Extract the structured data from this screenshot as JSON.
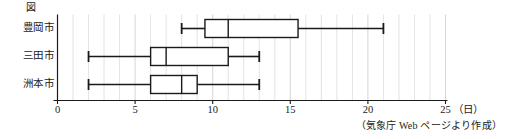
{
  "figure": {
    "label": "図",
    "source_note": "（気象庁 Web ページより作成）",
    "unit_label": "（日）"
  },
  "axis": {
    "tick_labels": [
      "0",
      "5",
      "10",
      "15",
      "20",
      "25"
    ],
    "tick_values": [
      0,
      5,
      10,
      15,
      20,
      25
    ],
    "min": 0,
    "max": 25,
    "minor_step": 1
  },
  "categories": [
    {
      "label": "豊岡市"
    },
    {
      "label": "三田市"
    },
    {
      "label": "洲本市"
    }
  ],
  "colors": {
    "line": "#1a1a1a",
    "grid": "#cfcfcf",
    "box_fill": "#ffffff",
    "background": "#ffffff"
  },
  "chart_data": {
    "type": "box",
    "title": "図",
    "xlabel": "（日）",
    "ylabel": "",
    "xlim": [
      0,
      25
    ],
    "grid": true,
    "legend": "none",
    "orientation": "horizontal",
    "categories": [
      "豊岡市",
      "三田市",
      "洲本市"
    ],
    "boxes": [
      {
        "category": "豊岡市",
        "min": 8,
        "q1": 9.5,
        "median": 11,
        "q3": 15.5,
        "max": 21
      },
      {
        "category": "三田市",
        "min": 2,
        "q1": 6,
        "median": 7,
        "q3": 11,
        "max": 13
      },
      {
        "category": "洲本市",
        "min": 2,
        "q1": 6,
        "median": 8,
        "q3": 9,
        "max": 13
      }
    ],
    "annotation": "（気象庁 Web ページより作成）"
  }
}
